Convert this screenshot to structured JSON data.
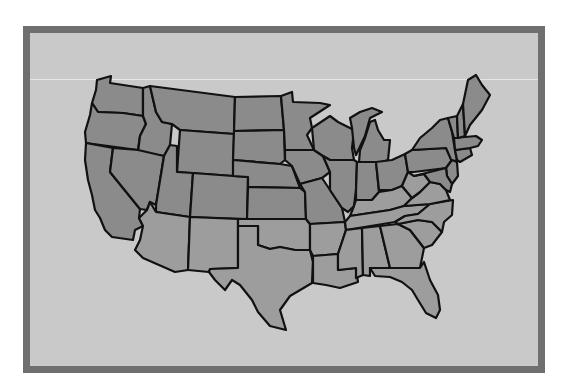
{
  "map": {
    "title": "United States",
    "colors": {
      "background": "#c9c9c9",
      "frame": "#6f6f6f",
      "north_fill": "#8b8b8b",
      "south_fill": "#9d9d9d",
      "border": "#111111"
    },
    "states": [
      {
        "name": "Washington",
        "region": "north",
        "points": "97,80 111,76 110,83 143,88 143,116 123,113 98,112 92,103 96,90"
      },
      {
        "name": "Oregon",
        "region": "north",
        "points": "92,103 98,112 123,113 143,116 146,124 140,136 138,150 86,143 85,132 90,115"
      },
      {
        "name": "California",
        "region": "north",
        "points": "86,143 113,148 110,172 140,209 139,218 143,226 135,230 133,240 112,237 105,230 100,218 95,210 92,195 88,180 85,160"
      },
      {
        "name": "Idaho",
        "region": "north",
        "points": "143,88 150,86 156,112 162,122 172,124 170,145 164,156 138,152 140,136 146,124 143,116"
      },
      {
        "name": "Nevada",
        "region": "north",
        "points": "113,148 138,150 164,156 156,205 150,202 147,210 140,209 110,172"
      },
      {
        "name": "Montana",
        "region": "north",
        "points": "150,86 235,97 234,134 180,130 172,124 162,122 156,112"
      },
      {
        "name": "Wyoming",
        "region": "north",
        "points": "180,130 234,134 233,176 177,172"
      },
      {
        "name": "Utah",
        "region": "north",
        "points": "164,156 170,145 177,146 177,172 193,173 190,217 156,212 156,205"
      },
      {
        "name": "Colorado",
        "region": "north",
        "points": "193,173 233,176 248,177 247,219 190,217"
      },
      {
        "name": "Arizona",
        "region": "south",
        "points": "156,212 190,217 188,270 175,272 143,258 135,250 140,240 143,226 139,218 147,210 150,202"
      },
      {
        "name": "New Mexico",
        "region": "south",
        "points": "190,217 238,219 238,268 210,269 209,272 188,270"
      },
      {
        "name": "North Dakota",
        "region": "north",
        "points": "235,97 281,96 284,130 234,131"
      },
      {
        "name": "South Dakota",
        "region": "north",
        "points": "234,131 284,130 285,160 280,164 233,160"
      },
      {
        "name": "Nebraska",
        "region": "north",
        "points": "233,160 280,164 292,166 300,188 248,187 248,177 233,176"
      },
      {
        "name": "Kansas",
        "region": "north",
        "points": "248,187 300,188 305,192 306,219 247,219"
      },
      {
        "name": "Oklahoma",
        "region": "south",
        "points": "238,219 306,219 310,224 310,250 295,250 280,247 270,249 258,245 258,226 238,226"
      },
      {
        "name": "Texas",
        "region": "south",
        "points": "238,226 258,226 258,245 270,249 280,247 295,250 310,250 313,262 312,283 290,296 280,310 286,330 270,326 258,312 252,300 240,285 232,280 225,290 215,280 209,272 210,269 238,268"
      },
      {
        "name": "Minnesota",
        "region": "north",
        "points": "281,96 292,92 293,102 320,103 330,105 310,118 312,128 307,135 314,150 292,150 285,150 284,130"
      },
      {
        "name": "Iowa",
        "region": "north",
        "points": "285,150 314,150 323,156 330,172 322,178 300,184 292,166 285,160"
      },
      {
        "name": "Missouri",
        "region": "north",
        "points": "300,184 322,178 330,190 342,208 345,222 310,224 306,219 305,192"
      },
      {
        "name": "Arkansas",
        "region": "south",
        "points": "310,224 345,222 346,230 341,245 338,254 313,256 310,250"
      },
      {
        "name": "Louisiana",
        "region": "south",
        "points": "313,256 338,254 338,270 356,268 358,282 340,288 326,285 313,283 313,262"
      },
      {
        "name": "Wisconsin",
        "region": "north",
        "points": "312,128 330,116 338,122 354,130 352,148 354,160 330,160 323,156 314,150"
      },
      {
        "name": "Illinois",
        "region": "north",
        "points": "330,160 354,160 357,162 356,190 354,206 348,212 342,208 330,190 330,172 323,156"
      },
      {
        "name": "Michigan",
        "region": "north",
        "points": "352,128 350,118 360,112 372,108 382,112 370,118 365,136 356,155 354,148"
      },
      {
        "name": "Michigan Lower",
        "region": "north",
        "points": "365,138 370,122 375,120 378,130 384,140 390,140 388,160 382,162 359,162 360,150"
      },
      {
        "name": "Indiana",
        "region": "north",
        "points": "357,162 376,162 379,192 372,200 356,200 356,190"
      },
      {
        "name": "Ohio",
        "region": "north",
        "points": "376,162 392,160 405,154 408,172 402,186 392,190 379,190"
      },
      {
        "name": "Kentucky",
        "region": "south",
        "points": "354,206 356,200 372,200 379,192 392,190 402,186 412,198 404,206 390,210 350,216"
      },
      {
        "name": "Tennessee",
        "region": "south",
        "points": "350,216 390,210 404,206 430,204 418,214 405,216 395,222 346,230 345,222"
      },
      {
        "name": "Mississippi",
        "region": "south",
        "points": "346,230 362,228 363,275 356,278 356,268 338,270 338,254 341,245"
      },
      {
        "name": "Alabama",
        "region": "south",
        "points": "362,228 380,226 390,268 370,268 370,276 363,275"
      },
      {
        "name": "Georgia",
        "region": "south",
        "points": "380,226 398,224 410,230 424,248 420,268 390,268"
      },
      {
        "name": "Florida",
        "region": "south",
        "points": "370,268 420,268 424,262 430,280 438,295 440,310 436,318 426,313 418,300 412,290 402,282 390,277 375,276"
      },
      {
        "name": "South Carolina",
        "region": "south",
        "points": "398,224 418,220 432,222 442,232 432,245 424,248 410,230"
      },
      {
        "name": "North Carolina",
        "region": "south",
        "points": "395,222 405,216 418,214 430,204 453,200 452,215 444,222 442,232 432,222 418,220 398,224"
      },
      {
        "name": "Virginia",
        "region": "south",
        "points": "404,206 412,198 420,192 430,182 440,184 446,190 450,200 430,204"
      },
      {
        "name": "West Virginia",
        "region": "south",
        "points": "402,186 408,172 414,176 424,174 430,182 420,192 412,198"
      },
      {
        "name": "Pennsylvania",
        "region": "north",
        "points": "405,154 412,150 446,148 452,160 446,168 414,172 408,172"
      },
      {
        "name": "New York",
        "region": "north",
        "points": "412,150 420,138 432,128 440,120 448,118 452,132 455,150 457,160 452,162 446,148"
      },
      {
        "name": "New Jersey",
        "region": "north",
        "points": "446,168 452,160 457,162 458,176 452,184 447,176"
      },
      {
        "name": "Maryland Delaware",
        "region": "north",
        "points": "414,176 446,168 447,176 452,184 450,192 446,190 440,184 430,182 424,174"
      },
      {
        "name": "Connecticut Rhode Island",
        "region": "north",
        "points": "455,150 470,148 472,155 460,162 457,160"
      },
      {
        "name": "Massachusetts",
        "region": "north",
        "points": "454,138 476,136 482,140 478,146 470,148 455,150"
      },
      {
        "name": "Vermont",
        "region": "north",
        "points": "448,118 457,116 458,138 454,138"
      },
      {
        "name": "New Hampshire",
        "region": "north",
        "points": "457,116 463,104 465,136 458,138"
      },
      {
        "name": "Maine",
        "region": "north",
        "points": "463,104 468,80 476,75 482,85 490,95 482,110 470,125 465,136"
      }
    ]
  }
}
